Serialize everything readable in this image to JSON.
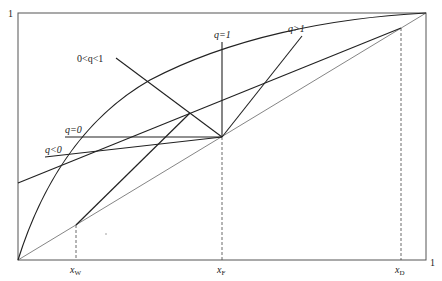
{
  "diagram": {
    "axis": {
      "origin_label": "",
      "y_max_label": "1",
      "x_max_label": "1"
    },
    "x_marks": [
      {
        "name": "x-w",
        "base": "x",
        "sub": "W"
      },
      {
        "name": "x-f",
        "base": "x",
        "sub": "F"
      },
      {
        "name": "x-d",
        "base": "x",
        "sub": "D"
      }
    ],
    "q_lines": [
      {
        "name": "q-gt-1",
        "label": "q>1"
      },
      {
        "name": "q-eq-1",
        "label": "q=1"
      },
      {
        "name": "q-between-0-1",
        "label": "0<q<1"
      },
      {
        "name": "q-eq-0",
        "label": "q=0"
      },
      {
        "name": "q-lt-0",
        "label": "q<0"
      }
    ],
    "curves": [
      {
        "name": "equilibrium-curve"
      },
      {
        "name": "diagonal-line"
      },
      {
        "name": "rectifying-operating-line"
      },
      {
        "name": "stripping-operating-line"
      }
    ],
    "colors": {
      "line": "#222222",
      "frame": "#555555",
      "diagonal": "#666666"
    }
  }
}
